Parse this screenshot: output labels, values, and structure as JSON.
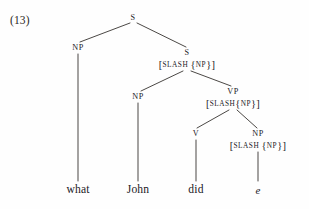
{
  "figure": {
    "example_number": "(13)",
    "sentence": "what John did e",
    "type": "syntax-tree"
  },
  "nodes": {
    "root_s": {
      "label": "S",
      "x": 133,
      "y": 18
    },
    "np_wh": {
      "label": "NP",
      "x": 78,
      "y": 48
    },
    "s_slash": {
      "label": "S",
      "x": 187,
      "y": 53,
      "feature": "[SLASH {NP}]",
      "feature_y": 65
    },
    "np_subj": {
      "label": "NP",
      "x": 138,
      "y": 97
    },
    "vp_slash": {
      "label": "VP",
      "x": 233,
      "y": 92,
      "feature": "[SLASH{NP}]",
      "feature_y": 104
    },
    "v": {
      "label": "V",
      "x": 196,
      "y": 134
    },
    "np_trace": {
      "label": "NP",
      "x": 258,
      "y": 134,
      "feature": "[SLASH {NP}]",
      "feature_y": 146
    }
  },
  "features": {
    "bracket_open": "[",
    "bracket_close": "]",
    "slash": "SLASH",
    "brace_open": "{",
    "brace_close": "}",
    "np": "NP"
  },
  "terminals": [
    {
      "text": "what",
      "x": 78,
      "y": 190,
      "italic": false
    },
    {
      "text": "John",
      "x": 138,
      "y": 190,
      "italic": false
    },
    {
      "text": "did",
      "x": 196,
      "y": 190,
      "italic": false
    },
    {
      "text": "e",
      "x": 258,
      "y": 190,
      "italic": true
    }
  ],
  "style": {
    "line_color": "#2b2724",
    "text_color": "#23201e",
    "background": "#fefefe"
  }
}
